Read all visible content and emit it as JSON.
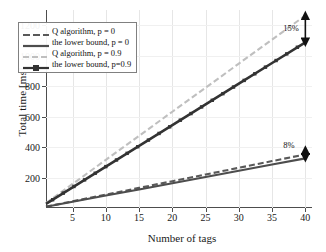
{
  "chart_data": {
    "type": "line",
    "title": "",
    "xlabel": "Number of tags",
    "ylabel": "Total time [ms]",
    "xlim": [
      1,
      41
    ],
    "ylim": [
      0,
      1300
    ],
    "xticks": [
      5,
      10,
      15,
      20,
      25,
      30,
      35,
      40
    ],
    "yticks": [
      200,
      400,
      600,
      800,
      1000,
      1200
    ],
    "grid": "vertical-faint",
    "legend_position": "upper-left-inside",
    "x": [
      1,
      5,
      10,
      15,
      20,
      25,
      30,
      35,
      40
    ],
    "series": [
      {
        "name": "Q algorithm, p = 0",
        "style": "dashed",
        "color": "#595959",
        "marker": "none",
        "values": [
          9,
          44,
          88,
          132,
          176,
          220,
          264,
          308,
          352
        ]
      },
      {
        "name": "the lower bound, p = 0",
        "style": "solid",
        "color": "#4d4d4d",
        "marker": "none",
        "values": [
          8,
          41,
          82,
          122,
          163,
          204,
          245,
          286,
          326
        ]
      },
      {
        "name": "Q algorithm, p = 0.9",
        "style": "dashed",
        "color": "#bfbfbf",
        "marker": "none",
        "values": [
          32,
          158,
          316,
          474,
          632,
          790,
          948,
          1106,
          1264
        ]
      },
      {
        "name": "the lower bound, p=0.9",
        "style": "solid-marker",
        "color": "#333333",
        "marker": "square",
        "values": [
          27,
          136,
          272,
          408,
          544,
          680,
          816,
          952,
          1088
        ]
      }
    ],
    "annotations": [
      {
        "label": "15%",
        "x": 40,
        "y_top": 1264,
        "y_bottom": 1088,
        "arrow": "double-headed-vertical"
      },
      {
        "label": "8%",
        "x": 40,
        "y_top": 380,
        "y_bottom": 330,
        "arrow": "double-headed-vertical"
      }
    ]
  },
  "legend": {
    "items": [
      {
        "label": "Q algorithm, p = 0"
      },
      {
        "label": "the lower bound, p = 0"
      },
      {
        "label": "Q algorithm, p = 0.9"
      },
      {
        "label": "the lower bound, p=0.9"
      }
    ]
  },
  "axes": {
    "xlabel": "Number of tags",
    "ylabel": "Total time [ms]",
    "xticklabels": [
      "5",
      "10",
      "15",
      "20",
      "25",
      "30",
      "35",
      "40"
    ],
    "yticklabels": [
      "200",
      "400",
      "600",
      "800",
      "1000",
      "1200"
    ]
  },
  "annotations": {
    "upper": "15%",
    "lower": "8%"
  },
  "colors": {
    "axis": "#4d4d4d",
    "grid": "#e6e6e6",
    "series_dark": "#4d4d4d",
    "series_light": "#bfbfbf",
    "text": "#111111"
  }
}
